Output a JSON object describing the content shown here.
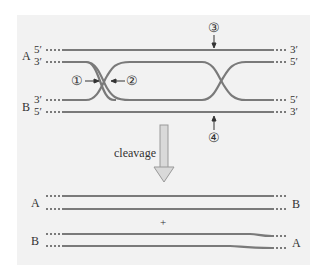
{
  "diagram": {
    "colors": {
      "strand": "#7a7a7a",
      "text": "#333333",
      "background": "#f2f2f2",
      "arrow_fill": "#d9d9d9",
      "arrow_stroke": "#999999"
    },
    "top": {
      "duplex_A": {
        "label": "A",
        "left_top": "5′",
        "left_bottom": "3′",
        "right_top": "3′",
        "right_bottom": "5′"
      },
      "duplex_B": {
        "label": "B",
        "left_top": "3′",
        "left_bottom": "5′",
        "right_top": "5′",
        "right_bottom": "3′"
      },
      "markers": [
        "①",
        "②",
        "③",
        "④"
      ]
    },
    "step_label": "cleavage",
    "bottom": {
      "product1": {
        "left": "A",
        "right": "B"
      },
      "plus": "+",
      "product2": {
        "left": "B",
        "right": "A"
      }
    }
  }
}
